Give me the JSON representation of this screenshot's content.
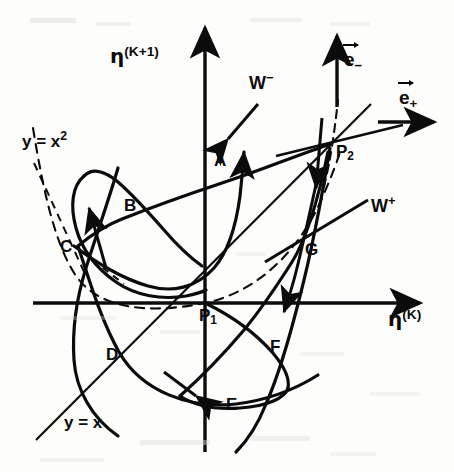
{
  "figure": {
    "background_color": "#fdfdfc",
    "ink_color": "#0b0b0b",
    "axes": {
      "x_axis_label": "η",
      "x_axis_superscript": "(K)",
      "y_axis_label": "η",
      "y_axis_superscript": "(K+1)",
      "origin_label": "P",
      "origin_subscript": "1",
      "x_axis_arrow": true,
      "y_axis_arrow": true,
      "origin_px": [
        205,
        303
      ]
    },
    "fixed_points": [
      {
        "name": "P1",
        "label": "P",
        "subscript": "1",
        "px": [
          205,
          303
        ]
      },
      {
        "name": "P2",
        "label": "P",
        "subscript": "2",
        "px": [
          331,
          144
        ]
      }
    ],
    "manifolds": [
      {
        "name": "W-minus",
        "label": "W",
        "superscript": "−",
        "px": [
          258,
          85
        ]
      },
      {
        "name": "W-plus",
        "label": "W",
        "superscript": "+",
        "px": [
          379,
          208
        ]
      }
    ],
    "eigenvectors": [
      {
        "name": "e-minus",
        "label": "e",
        "subscript": "−",
        "direction": "up",
        "px": [
          347,
          60
        ]
      },
      {
        "name": "e-plus",
        "label": "e",
        "subscript": "+",
        "direction": "right",
        "px": [
          405,
          97
        ]
      }
    ],
    "reference_curves": [
      {
        "name": "parabola",
        "label": "y = x",
        "superscript": "2",
        "style": "dashed",
        "px": [
          22,
          144
        ]
      },
      {
        "name": "diagonal",
        "label": "y = x",
        "superscript": "",
        "style": "solid",
        "px": [
          72,
          424
        ]
      }
    ],
    "intersection_points": [
      {
        "label": "A",
        "px": [
          219,
          161
        ]
      },
      {
        "label": "B",
        "px": [
          129,
          206
        ]
      },
      {
        "label": "C",
        "px": [
          70,
          246
        ]
      },
      {
        "label": "D",
        "px": [
          114,
          355
        ]
      },
      {
        "label": "E",
        "px": [
          232,
          404
        ]
      },
      {
        "label": "F",
        "px": [
          276,
          347
        ]
      },
      {
        "label": "G",
        "px": [
          311,
          250
        ]
      }
    ]
  }
}
